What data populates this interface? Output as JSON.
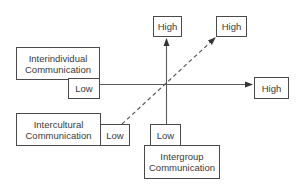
{
  "diagram": {
    "title": "",
    "colors": {
      "line": "#4a4a4a",
      "text": "#3a3a3a",
      "background": "#ffffff"
    },
    "axes": [
      {
        "id": "interindividual",
        "label_line1": "Interindividual",
        "label_line2": "Communication",
        "low": "Low",
        "high": "High",
        "direction": "horizontal",
        "style": "solid"
      },
      {
        "id": "intergroup",
        "label_line1": "Intergroup",
        "label_line2": "Communication",
        "low": "Low",
        "high": "High",
        "direction": "vertical",
        "style": "solid"
      },
      {
        "id": "intercultural",
        "label_line1": "Intercultural",
        "label_line2": "Communication",
        "low": "Low",
        "high": "High",
        "direction": "diagonal",
        "style": "dashed"
      }
    ]
  }
}
